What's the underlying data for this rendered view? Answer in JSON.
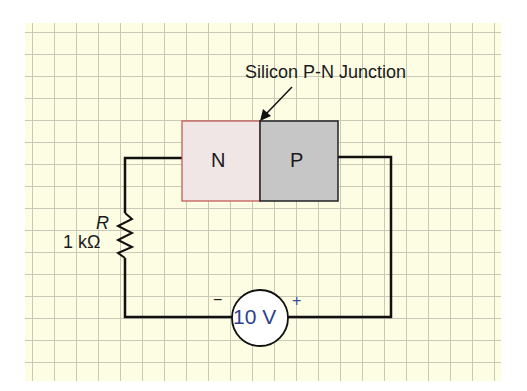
{
  "diagram": {
    "title_annotation": "Silicon P-N Junction",
    "n_region_label": "N",
    "p_region_label": "P",
    "resistor": {
      "symbol": "R",
      "value": "1 kΩ"
    },
    "source": {
      "value": "10 V",
      "negative_terminal": "−",
      "positive_terminal": "+"
    },
    "colors": {
      "background_grid": "#fdfde4",
      "grid_lines": "#c9c9b8",
      "n_region_fill": "#f0e6e6",
      "n_region_border": "#c0504d",
      "p_region_fill": "#c6c6c6",
      "wire": "#111111",
      "source_text": "#2e3f8f"
    }
  }
}
